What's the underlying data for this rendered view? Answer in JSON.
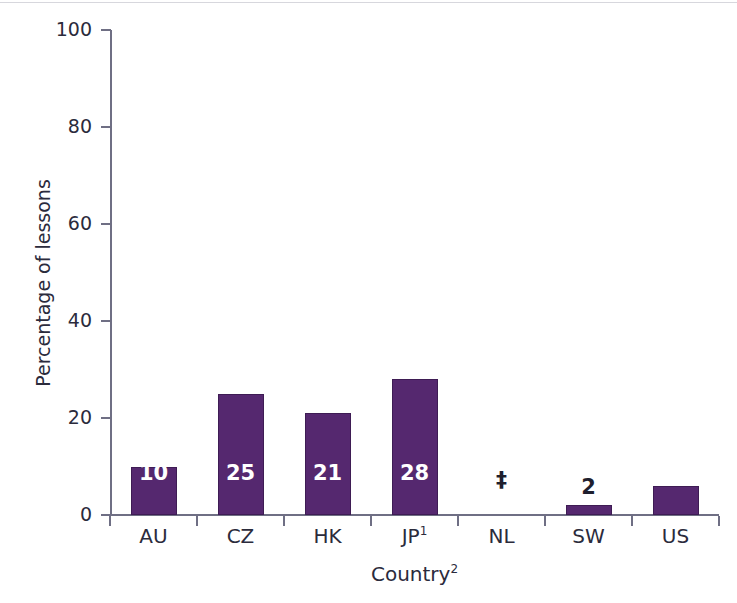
{
  "chart_data": {
    "type": "bar",
    "title": "",
    "subtitle": "",
    "xlabel": "Country",
    "xlabel_superscript": "2",
    "ylabel": "Percentage of lessons",
    "ylim": [
      0,
      100
    ],
    "ytick_values": [
      0,
      20,
      40,
      60,
      80,
      100
    ],
    "ytick_labels": [
      "0",
      "20",
      "40",
      "60",
      "80",
      "100"
    ],
    "grid": false,
    "legend": false,
    "categories": [
      "AU",
      "CZ",
      "HK",
      "JP",
      "NL",
      "SW",
      "US"
    ],
    "category_superscripts": [
      "",
      "",
      "",
      "1",
      "",
      "",
      ""
    ],
    "values": [
      10,
      25,
      21,
      28,
      null,
      2,
      6
    ],
    "data_labels": [
      "10",
      "25",
      "21",
      "28",
      "‡",
      "2",
      "6"
    ],
    "label_placement": [
      "inside",
      "inside",
      "inside",
      "inside",
      "above",
      "above",
      "inside"
    ],
    "bar_color": "#55286F",
    "bar_border_color": "#3E1C54",
    "inside_label_color": "#FFFFFF",
    "outside_label_color": "#1F1F2E",
    "axis_color": "#6F6F84",
    "text_color": "#2B2B3C",
    "notes": {
      "suppressed_symbol": "‡",
      "suppressed_category": "NL"
    },
    "bars": [
      {
        "category": "AU",
        "label": "AU",
        "superscript": "",
        "value": 10,
        "display": "10",
        "placement": "inside"
      },
      {
        "category": "CZ",
        "label": "CZ",
        "superscript": "",
        "value": 25,
        "display": "25",
        "placement": "inside"
      },
      {
        "category": "HK",
        "label": "HK",
        "superscript": "",
        "value": 21,
        "display": "21",
        "placement": "inside"
      },
      {
        "category": "JP",
        "label": "JP",
        "superscript": "1",
        "value": 28,
        "display": "28",
        "placement": "inside"
      },
      {
        "category": "NL",
        "label": "NL",
        "superscript": "",
        "value": null,
        "display": "‡",
        "placement": "above"
      },
      {
        "category": "SW",
        "label": "SW",
        "superscript": "",
        "value": 2,
        "display": "2",
        "placement": "above"
      },
      {
        "category": "US",
        "label": "US",
        "superscript": "",
        "value": 6,
        "display": "6",
        "placement": "inside"
      }
    ]
  }
}
